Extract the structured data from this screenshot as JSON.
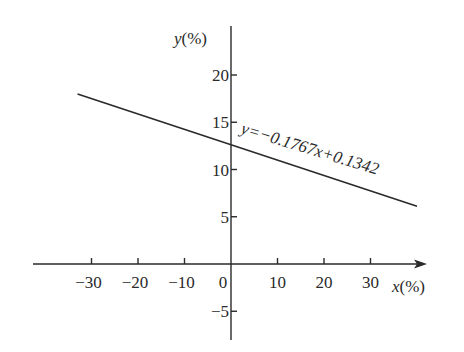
{
  "chart_data": {
    "type": "line",
    "title": "",
    "xlabel": "x(%)",
    "ylabel": "y(%)",
    "x_ticks": [
      -30,
      -20,
      -10,
      0,
      10,
      20,
      30
    ],
    "x_tick_labels": [
      "−30",
      "−20",
      "−10",
      "0",
      "10",
      "20",
      "30"
    ],
    "y_ticks": [
      -5,
      5,
      10,
      15,
      20
    ],
    "y_tick_labels": [
      "−5",
      "5",
      "10",
      "15",
      "20"
    ],
    "xlim": [
      -42,
      41
    ],
    "ylim": [
      -8,
      25
    ],
    "grid": false,
    "legend": null,
    "series": [
      {
        "name": "fit",
        "x": [
          -33,
          40
        ],
        "y": [
          18.0,
          6.1
        ]
      }
    ],
    "annotations": [
      {
        "text": "y=−0.1767x+0.1342",
        "x": 0.5,
        "y": 13.5,
        "rotation": 17
      }
    ]
  },
  "labels": {
    "x_axis": "x(%)",
    "y_axis": "y(%)",
    "equation": "y=−0.1767x+0.1342"
  }
}
